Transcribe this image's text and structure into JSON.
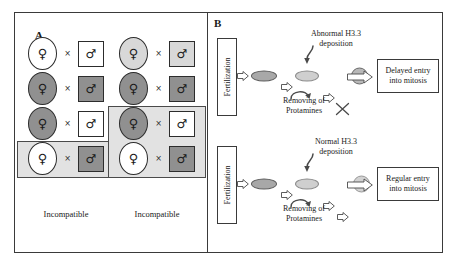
{
  "figure": {
    "panels": [
      {
        "letter": "A"
      },
      {
        "letter": "B"
      }
    ]
  },
  "panelA": {
    "letter": "A",
    "female_glyph": "♀",
    "male_glyph": "♂",
    "cross_symbol": "×",
    "columns": [
      {
        "id": "left",
        "caption": "Incompatible",
        "highlight_rows": [
          3
        ],
        "rows": [
          {
            "female_fill": "white",
            "male_fill": "white"
          },
          {
            "female_fill": "dark",
            "male_fill": "dark"
          },
          {
            "female_fill": "dark",
            "male_fill": "white"
          },
          {
            "female_fill": "white",
            "male_fill": "dark"
          }
        ]
      },
      {
        "id": "right",
        "caption": "Incompatible",
        "highlight_rows": [
          2,
          3
        ],
        "rows": [
          {
            "female_fill": "light",
            "male_fill": "light"
          },
          {
            "female_fill": "dark",
            "male_fill": "dark"
          },
          {
            "female_fill": "dark",
            "male_fill": "white"
          },
          {
            "female_fill": "white",
            "male_fill": "dark"
          }
        ]
      }
    ]
  },
  "panelB": {
    "letter": "B",
    "pathways": [
      {
        "id": "abnormal",
        "fertilization_label": "Fertilization",
        "deposition_label_line1": "Abnormal H3.3",
        "deposition_label_line2": "deposition",
        "protamines_label_line1": "Removing of",
        "protamines_label_line2": "Protamines",
        "blocked": true,
        "result_line1": "Delayed entry",
        "result_line2": "into mitosis"
      },
      {
        "id": "normal",
        "fertilization_label": "Fertilization",
        "deposition_label_line1": "Normal H3.3",
        "deposition_label_line2": "deposition",
        "protamines_label_line1": "Removing of",
        "protamines_label_line2": "Protamines",
        "blocked": false,
        "result_line1": "Regular entry",
        "result_line2": "into mitosis"
      }
    ]
  },
  "colors": {
    "frame": "#3a3a3a",
    "fill_white": "#ffffff",
    "fill_light": "#d8d8d8",
    "fill_dark": "#909090",
    "highlight": "#e2e2e2",
    "nucleus_dark": "#a8a8a8",
    "nucleus_light": "#cfcfcf",
    "text": "#1a1a1a"
  }
}
